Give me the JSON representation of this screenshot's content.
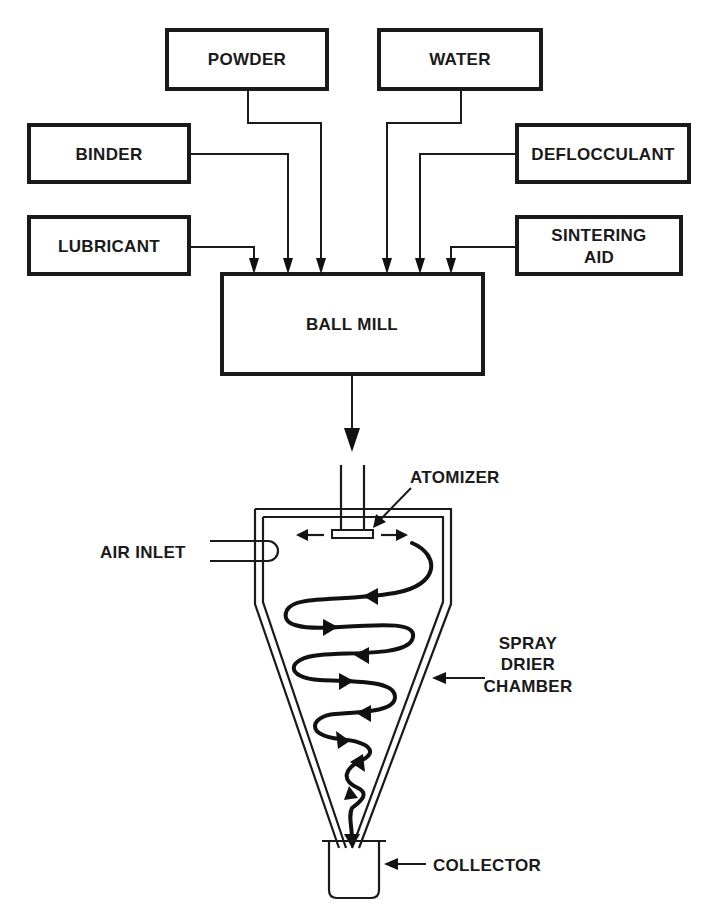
{
  "diagram": {
    "inputs": {
      "powder": "POWDER",
      "water": "WATER",
      "binder": "BINDER",
      "deflocculant": "DEFLOCCULANT",
      "lubricant": "LUBRICANT",
      "sintering_aid_line1": "SINTERING",
      "sintering_aid_line2": "AID"
    },
    "ball_mill": "BALL MILL",
    "spray_drier": {
      "atomizer": "ATOMIZER",
      "air_inlet": "AIR INLET",
      "chamber_line1": "SPRAY",
      "chamber_line2": "DRIER",
      "chamber_line3": "CHAMBER",
      "collector": "COLLECTOR"
    },
    "colors": {
      "ink": "#1a1a1a",
      "background": "#ffffff"
    }
  }
}
